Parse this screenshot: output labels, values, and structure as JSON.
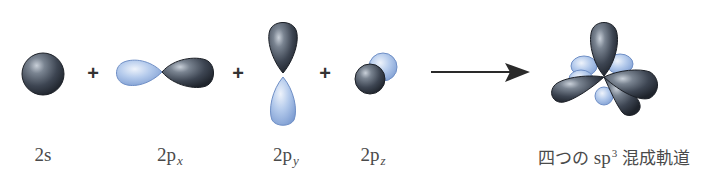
{
  "diagram": {
    "operators": [
      "+",
      "+",
      "+"
    ],
    "orbitals": [
      {
        "id": "2s",
        "label_main": "2s",
        "label_sub": ""
      },
      {
        "id": "2px",
        "label_main": "2p",
        "label_sub": "x"
      },
      {
        "id": "2py",
        "label_main": "2p",
        "label_sub": "y"
      },
      {
        "id": "2pz",
        "label_main": "2p",
        "label_sub": "z"
      }
    ],
    "result": {
      "label_prefix": "四つの",
      "label_sp": "sp",
      "label_sup": "3",
      "label_suffix": "混成軌道"
    },
    "colors": {
      "dark_lobe": "#3b4350",
      "dark_highlight": "#aab2bd",
      "light_lobe": "#8fb0e0",
      "light_highlight": "#dde8f7",
      "arrow": "#2a2a2a",
      "text": "#4a4a4a"
    }
  }
}
